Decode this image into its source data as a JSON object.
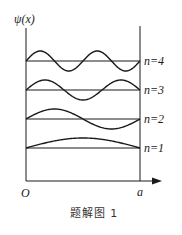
{
  "figure": {
    "ylabel": "ψ(x)",
    "origin_label": "O",
    "right_wall_label": "a",
    "caption": "题解图 1",
    "levels": [
      {
        "n": 4,
        "label": "n=4",
        "half_waves": 4
      },
      {
        "n": 3,
        "label": "n=3",
        "half_waves": 3
      },
      {
        "n": 2,
        "label": "n=2",
        "half_waves": 2
      },
      {
        "n": 1,
        "label": "n=1",
        "half_waves": 1
      }
    ],
    "line_color": "#1a1a1a"
  },
  "chart_data": {
    "type": "line",
    "title": "题解图 1",
    "xlabel": "x (O to a)",
    "ylabel": "ψ(x)",
    "x_ticks": [
      "O",
      "a"
    ],
    "series": [
      {
        "name": "n=4",
        "function": "sin(4πx/a)",
        "baseline_order": 4
      },
      {
        "name": "n=3",
        "function": "sin(3πx/a)",
        "baseline_order": 3
      },
      {
        "name": "n=2",
        "function": "sin(2πx/a)",
        "baseline_order": 2
      },
      {
        "name": "n=1",
        "function": "sin(πx/a)",
        "baseline_order": 1
      }
    ],
    "grid": false,
    "legend": "inline labels at right"
  }
}
